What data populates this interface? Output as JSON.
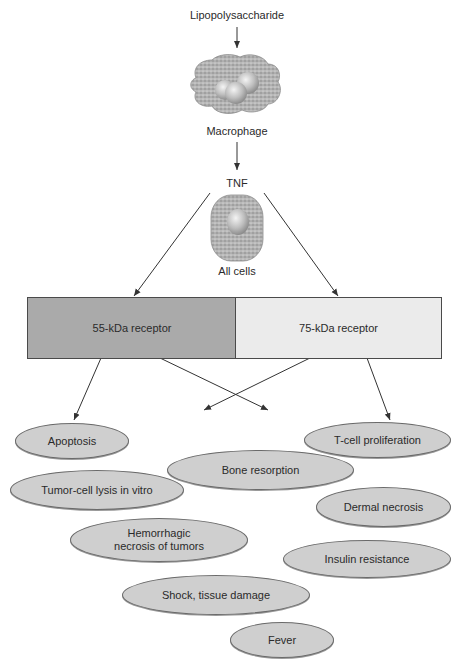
{
  "diagram": {
    "nodes": {
      "stimulus": "Lipopolysaccharide",
      "producer": "Macrophage",
      "cytokine": "TNF",
      "targets": "All cells"
    },
    "receptors": [
      {
        "label": "55-kDa receptor",
        "color": "#aaaaaa"
      },
      {
        "label": "75-kDa receptor",
        "color": "#ebebeb"
      }
    ],
    "effects": [
      {
        "label": "Apoptosis"
      },
      {
        "label": "T-cell proliferation"
      },
      {
        "label": "Bone resorption"
      },
      {
        "label": "Tumor-cell lysis in vitro"
      },
      {
        "label": "Dermal necrosis"
      },
      {
        "label": "Hemorrhagic necrosis of tumors",
        "line1": "Hemorrhagic",
        "line2": "necrosis of tumors"
      },
      {
        "label": "Insulin resistance"
      },
      {
        "label": "Shock, tissue damage"
      },
      {
        "label": "Fever"
      }
    ],
    "colors": {
      "ellipse_fill": "#cfcfcf",
      "cell_stipple": "#9c9c9c",
      "arrow": "#333333"
    }
  }
}
